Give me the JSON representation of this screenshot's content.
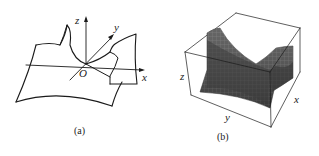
{
  "figure": {
    "panels": [
      {
        "id": "a",
        "caption": "(a)",
        "description": "Line drawing of a saddle surface (hyperbolic paraboloid) with coordinate axes",
        "axes": {
          "x": "x",
          "y": "y",
          "z": "z",
          "origin": "O"
        }
      },
      {
        "id": "b",
        "caption": "(b)",
        "description": "Shaded 3D mesh plot of a saddle surface inside a bounding box",
        "axes": {
          "x": "x",
          "y": "y",
          "z": "z"
        },
        "surface_color": "#4a4a4a",
        "mesh_color": "#7a7a7a"
      }
    ]
  }
}
